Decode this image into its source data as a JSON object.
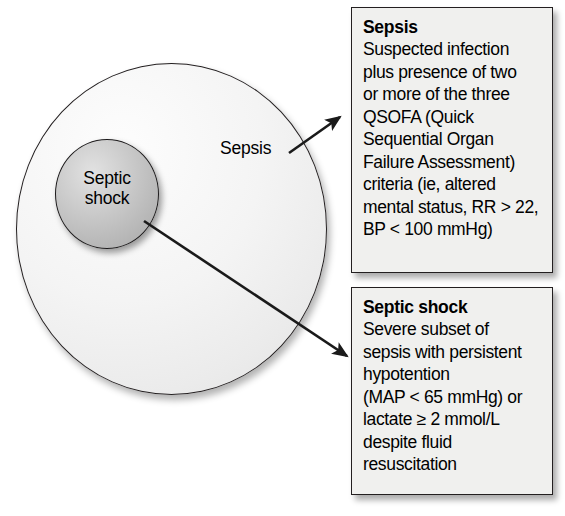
{
  "figure": {
    "type": "venn-containment-diagram"
  },
  "diagram": {
    "outer_circle": {
      "label": "Sepsis",
      "fill_color": "#ebebeb",
      "stroke_color": "#231f20"
    },
    "inner_circle": {
      "label_line1": "Septic",
      "label_line2": "shock",
      "fill_color": "#bcbcbc",
      "stroke_color": "#1c1a1b"
    },
    "arrows": [
      {
        "name": "sepsis-arrow",
        "from_label": "Sepsis",
        "to_box": "Sepsis"
      },
      {
        "name": "septic-shock-arrow",
        "from_label": "Septic shock",
        "to_box": "Septic shock"
      }
    ]
  },
  "callouts": [
    {
      "id": "sepsis",
      "title": "Sepsis",
      "body": "Suspected infection\nplus presence of two\nor more of the three\nQSOFA (Quick\nSequential Organ\nFailure Assessment)\ncriteria (ie, altered\nmental status, RR > 22,\nBP < 100 mmHg)"
    },
    {
      "id": "septic-shock",
      "title": "Septic shock",
      "body": "Severe subset of\nsepsis with persistent\nhypotention\n(MAP < 65 mmHg) or\nlactate ≥ 2 mmol/L\ndespite fluid\nresuscitation"
    }
  ]
}
